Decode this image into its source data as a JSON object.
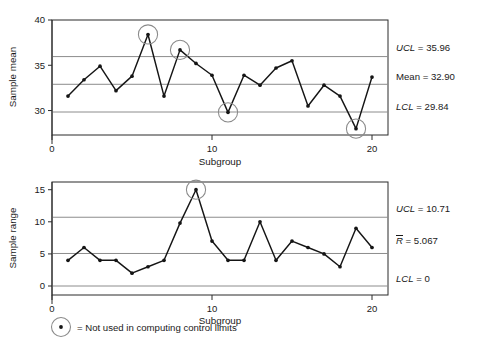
{
  "figure": {
    "legend": {
      "marker_name": "circled-point-marker",
      "text": "= Not used in computing control limits"
    }
  },
  "chart_data": [
    {
      "type": "line",
      "name": "x-bar-chart",
      "title": "",
      "xlabel": "Subgroup",
      "ylabel": "Sample mean",
      "x": [
        1,
        2,
        3,
        4,
        5,
        6,
        7,
        8,
        9,
        10,
        11,
        12,
        13,
        14,
        15,
        16,
        17,
        18,
        19,
        20
      ],
      "values": [
        31.6,
        33.4,
        34.9,
        32.2,
        33.8,
        38.4,
        31.6,
        36.7,
        35.2,
        33.9,
        29.8,
        33.9,
        32.8,
        34.7,
        35.5,
        30.5,
        32.8,
        31.6,
        28.0,
        33.7
      ],
      "xlim": [
        0,
        21
      ],
      "ylim": [
        27.3,
        40.0
      ],
      "xticks": [
        0,
        10,
        20
      ],
      "xticklabels": [
        "0",
        "10",
        "20"
      ],
      "yticks": [
        30,
        35,
        40
      ],
      "yticklabels": [
        "30",
        "35",
        "40"
      ],
      "grid": true,
      "control_limits": [
        {
          "key": "UCL",
          "label_italic": "UCL",
          "label_plain": " = 35.96",
          "value": 35.96
        },
        {
          "key": "Mean",
          "label_italic": "",
          "label_plain": "Mean = 32.90",
          "value": 32.9
        },
        {
          "key": "LCL",
          "label_italic": "LCL",
          "label_plain": " = 29.84",
          "value": 29.84
        }
      ],
      "highlighted_points": [
        6,
        8,
        11,
        19
      ],
      "legend_position": "right-outside"
    },
    {
      "type": "line",
      "name": "r-chart",
      "title": "",
      "xlabel": "Subgroup",
      "ylabel": "Sample range",
      "x": [
        1,
        2,
        3,
        4,
        5,
        6,
        7,
        8,
        9,
        10,
        11,
        12,
        13,
        14,
        15,
        16,
        17,
        18,
        19,
        20
      ],
      "values": [
        4.0,
        6.0,
        4.0,
        4.0,
        2.0,
        3.0,
        4.0,
        9.8,
        15.0,
        7.0,
        4.0,
        4.0,
        10.0,
        4.0,
        7.0,
        6.0,
        5.0,
        3.0,
        9.0,
        6.0
      ],
      "xlim": [
        0,
        21
      ],
      "ylim": [
        -1.4,
        16.2
      ],
      "xticks": [
        0,
        10,
        20
      ],
      "xticklabels": [
        "0",
        "10",
        "20"
      ],
      "yticks": [
        0,
        5,
        10,
        15
      ],
      "yticklabels": [
        "0",
        "5",
        "10",
        "15"
      ],
      "grid": true,
      "control_limits": [
        {
          "key": "UCL",
          "label_italic": "UCL",
          "label_plain": " = 10.71",
          "value": 10.71
        },
        {
          "key": "Rbar",
          "label_italic": "R",
          "label_plain": " = 5.067",
          "value": 5.067,
          "overbar": true
        },
        {
          "key": "LCL",
          "label_italic": "LCL",
          "label_plain": " = 0",
          "value": 0
        }
      ],
      "highlighted_points": [
        9
      ],
      "legend_position": "right-outside"
    }
  ]
}
